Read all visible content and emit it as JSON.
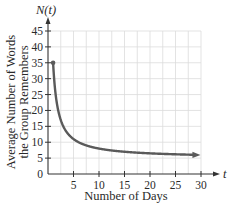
{
  "chart_data": {
    "type": "line",
    "title": "",
    "function": "N(t) = 5 + 30/t",
    "xlabel": "Number of Days",
    "ylabel_line1": "Average Number of Words",
    "ylabel_line2": "the Group Remembers",
    "x_var": "t",
    "y_var": "N(t)",
    "xlim": [
      0,
      30
    ],
    "ylim": [
      0,
      45
    ],
    "x_ticks": [
      5,
      10,
      15,
      20,
      25,
      30
    ],
    "y_ticks": [
      0,
      5,
      10,
      15,
      20,
      25,
      30,
      35,
      40,
      45
    ],
    "grid": true,
    "legend": null,
    "series": [
      {
        "name": "N(t)",
        "x": [
          1,
          1.5,
          2,
          3,
          4,
          5,
          6,
          8,
          10,
          12,
          15,
          20,
          25,
          29.5
        ],
        "values": [
          35,
          25,
          20,
          15,
          12.5,
          11,
          10,
          8.75,
          8,
          7.5,
          7,
          6.5,
          6.2,
          6.0
        ],
        "start_point": {
          "x": 1,
          "y": 35
        },
        "end_arrow": true
      }
    ]
  },
  "colors": {
    "curve": "#5a5a5a",
    "axis": "#333333",
    "grid": "#dcdcdc"
  }
}
